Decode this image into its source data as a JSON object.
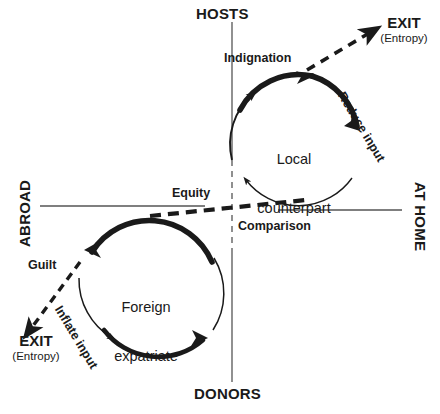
{
  "diagram": {
    "axes": {
      "vertical": {
        "top_label": "HOSTS",
        "bottom_label": "DONORS"
      },
      "horizontal": {
        "left_label": "ABROAD",
        "right_label": "AT HOME"
      }
    },
    "center_line": {
      "upper_label": "Equity",
      "lower_label": "Comparison"
    },
    "loops": [
      {
        "id": "local-counterpart",
        "node_label": "Local\ncounterpart",
        "node_label_line1": "Local",
        "node_label_line2": "counterpart",
        "inflow_label": "Indignation",
        "outflow_label": "Reduce input",
        "exit_label": "EXIT",
        "exit_sublabel": "(Entropy)"
      },
      {
        "id": "foreign-expatriate",
        "node_label": "Foreign\nexpatriate",
        "node_label_line1": "Foreign",
        "node_label_line2": "expatriate",
        "inflow_label": "Guilt",
        "outflow_label": "Inflate input",
        "exit_label": "EXIT",
        "exit_sublabel": "(Entropy)"
      }
    ],
    "colors": {
      "ink": "#1a1a1a",
      "line": "#555555",
      "background": "#ffffff"
    }
  }
}
